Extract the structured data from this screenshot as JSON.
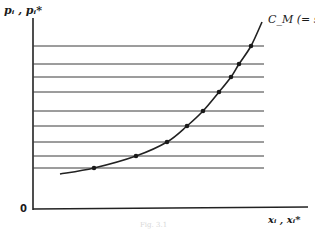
{
  "figure": {
    "y_axis_label": "pᵢ , pᵢ*",
    "x_axis_label": "xᵢ , xᵢ*",
    "origin_label": "0",
    "curve_label": "C_M (= s)",
    "caption": "Fig. 3.1",
    "colors": {
      "line": "#2a2a2a",
      "grid": "#3a3a3a",
      "background": "#ffffff"
    }
  },
  "chart_data": {
    "type": "line",
    "title": "",
    "xlabel": "xᵢ , xᵢ*",
    "ylabel": "pᵢ , pᵢ*",
    "curve": {
      "name": "C_M (= s)",
      "description": "Convex upward-sloping marginal cost / supply curve",
      "points_px": [
        [
          60,
          174
        ],
        [
          94,
          168
        ],
        [
          136,
          156
        ],
        [
          167,
          142
        ],
        [
          187,
          126
        ],
        [
          203,
          111
        ],
        [
          219,
          92
        ],
        [
          231,
          77
        ],
        [
          239,
          64
        ],
        [
          251,
          46
        ],
        [
          262,
          22
        ]
      ]
    },
    "horizontal_price_lines_y_px": [
      46,
      64,
      77,
      92,
      111,
      126,
      142,
      156,
      168
    ],
    "intersection_dots_px": [
      [
        94,
        168
      ],
      [
        136,
        156
      ],
      [
        167,
        142
      ],
      [
        187,
        126
      ],
      [
        203,
        111
      ],
      [
        219,
        92
      ],
      [
        231,
        77
      ],
      [
        239,
        64
      ],
      [
        251,
        46
      ]
    ],
    "axes": {
      "origin_px": [
        33,
        209
      ],
      "x_end_px": 308,
      "y_top_px": 18
    },
    "grid": false,
    "legend": "none"
  }
}
